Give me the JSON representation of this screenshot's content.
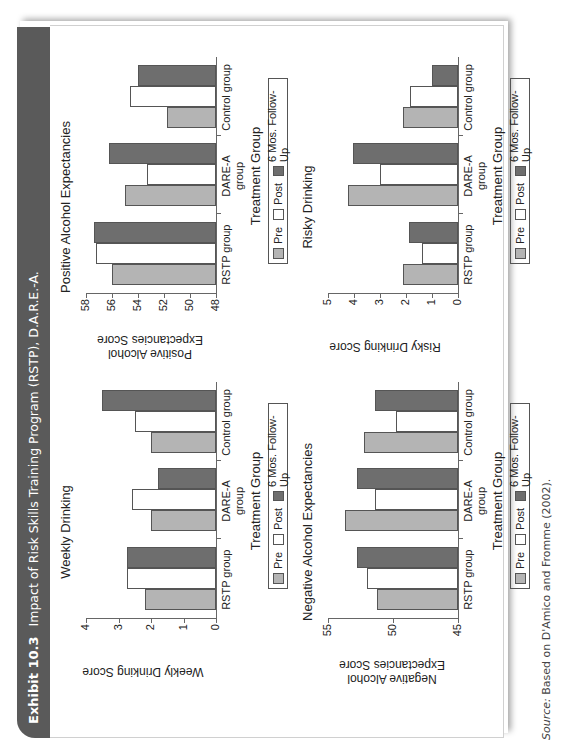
{
  "header": {
    "exhibit_label": "Exhibit 10.3",
    "title": "Impact of Risk Skills Training Program (RSTP), D.A.R.E.-A."
  },
  "source": {
    "label": "Source:",
    "text": "Based on D'Amico and Fromme (2002)."
  },
  "colors": {
    "pre": "#b4b4b4",
    "post": "#ffffff",
    "follow_up": "#6e6e6e",
    "header_bg": "#5a5a5a"
  },
  "legend": {
    "pre": "Pre",
    "post": "Post",
    "follow_up": "6 Mos. Follow-Up"
  },
  "chart_data": [
    {
      "type": "bar",
      "title": "Weekly Drinking",
      "xlabel": "Treatment Group",
      "ylabel": "Weekly Drinking Score",
      "ylim": [
        0,
        4
      ],
      "yticks": [
        0,
        1,
        2,
        3,
        4
      ],
      "categories": [
        "RSTP group",
        "DARE-A group",
        "Control group"
      ],
      "series": [
        {
          "name": "Pre",
          "values": [
            2.2,
            2.0,
            2.0
          ]
        },
        {
          "name": "Post",
          "values": [
            2.75,
            2.6,
            2.5
          ]
        },
        {
          "name": "6 Mos. Follow-Up",
          "values": [
            2.75,
            1.8,
            3.5
          ]
        }
      ],
      "legend_position": "bottom",
      "grid": false
    },
    {
      "type": "bar",
      "title": "Positive Alcohol Expectancies",
      "xlabel": "Treatment Group",
      "ylabel": "Positive Alcohol Expectancies Score",
      "ylim": [
        48,
        58
      ],
      "yticks": [
        48,
        50,
        52,
        54,
        56,
        58
      ],
      "categories": [
        "RSTP group",
        "DARE-A group",
        "Control group"
      ],
      "series": [
        {
          "name": "Pre",
          "values": [
            56.0,
            55.0,
            51.8
          ]
        },
        {
          "name": "Post",
          "values": [
            57.2,
            53.3,
            54.6
          ]
        },
        {
          "name": "6 Mos. Follow-Up",
          "values": [
            57.4,
            56.2,
            54.0
          ]
        }
      ],
      "legend_position": "bottom",
      "grid": false
    },
    {
      "type": "bar",
      "title": "Negative Alcohol Expectancies",
      "xlabel": "Treatment Group",
      "ylabel": "Negative Alcohol Expectancies Score",
      "ylim": [
        45,
        55
      ],
      "yticks": [
        45,
        50,
        55
      ],
      "categories": [
        "RSTP group",
        "DARE-A group",
        "Control group"
      ],
      "series": [
        {
          "name": "Pre",
          "values": [
            51.2,
            53.7,
            52.2
          ]
        },
        {
          "name": "Post",
          "values": [
            52.0,
            51.4,
            49.8
          ]
        },
        {
          "name": "6 Mos. Follow-Up",
          "values": [
            52.8,
            52.8,
            51.4
          ]
        }
      ],
      "legend_position": "bottom",
      "grid": false
    },
    {
      "type": "bar",
      "title": "Risky Drinking",
      "xlabel": "Treatment Group",
      "ylabel": "Risky Drinking Score",
      "ylim": [
        0,
        5
      ],
      "yticks": [
        0,
        1,
        2,
        3,
        4,
        5
      ],
      "categories": [
        "RSTP group",
        "DARE-A group",
        "Control group"
      ],
      "series": [
        {
          "name": "Pre",
          "values": [
            2.1,
            4.25,
            2.1
          ]
        },
        {
          "name": "Post",
          "values": [
            1.4,
            3.0,
            1.85
          ]
        },
        {
          "name": "6 Mos. Follow-Up",
          "values": [
            1.9,
            4.05,
            1.0
          ]
        }
      ],
      "legend_position": "bottom",
      "grid": false
    }
  ]
}
